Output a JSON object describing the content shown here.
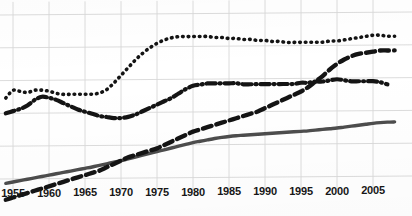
{
  "chart_data": {
    "type": "line",
    "title": "",
    "subtitle": "",
    "xlabel": "",
    "ylabel": "",
    "grid": true,
    "legend_position": "none",
    "xlim": [
      1953.5,
      2008.5
    ],
    "ylim": [
      0,
      100
    ],
    "xticks": [
      1955,
      1960,
      1965,
      1970,
      1975,
      1980,
      1985,
      1990,
      1995,
      2000,
      2005
    ],
    "xtick_labels": [
      "1955",
      "1960",
      "1965",
      "1970",
      "1975",
      "1980",
      "1985",
      "1990",
      "1995",
      "2000",
      "2005"
    ],
    "ytick_labels": [],
    "annotations": [],
    "series": [
      {
        "name": "series-dotted",
        "style": "dotted",
        "color": "#141414",
        "x": [
          1954,
          1955,
          1956,
          1957,
          1958,
          1959,
          1960,
          1961,
          1962,
          1963,
          1964,
          1965,
          1966,
          1967,
          1968,
          1969,
          1970,
          1971,
          1972,
          1973,
          1974,
          1975,
          1976,
          1977,
          1978,
          1979,
          1980,
          1981,
          1982,
          1983,
          1984,
          1985,
          1986,
          1987,
          1988,
          1989,
          1990,
          1991,
          1992,
          1993,
          1994,
          1995,
          1996,
          1997,
          1998,
          1999,
          2000,
          2001,
          2002,
          2003,
          2004,
          2005,
          2006,
          2007,
          2008
        ],
        "values": [
          57.0,
          60.5,
          60.0,
          59.5,
          60.5,
          60.5,
          60.0,
          59.0,
          58.5,
          58.5,
          58.5,
          58.5,
          58.5,
          59.0,
          60.5,
          63.5,
          67.0,
          70.5,
          74.0,
          77.0,
          79.5,
          81.5,
          83.0,
          84.0,
          84.5,
          84.5,
          84.5,
          84.5,
          84.5,
          84.0,
          84.0,
          83.5,
          83.5,
          83.0,
          83.0,
          82.5,
          82.5,
          82.0,
          82.0,
          81.5,
          81.5,
          81.5,
          81.5,
          81.5,
          81.5,
          82.0,
          82.0,
          82.5,
          83.0,
          83.5,
          84.0,
          84.5,
          84.5,
          84.0,
          84.0
        ]
      },
      {
        "name": "series-dashdot",
        "style": "dashdot",
        "color": "#141414",
        "x": [
          1954,
          1955,
          1956,
          1957,
          1958,
          1959,
          1960,
          1961,
          1962,
          1963,
          1964,
          1965,
          1966,
          1967,
          1968,
          1969,
          1970,
          1971,
          1972,
          1973,
          1974,
          1975,
          1976,
          1977,
          1978,
          1979,
          1980,
          1981,
          1982,
          1983,
          1984,
          1985,
          1986,
          1987,
          1988,
          1989,
          1990,
          1991,
          1992,
          1993,
          1994,
          1995,
          1996,
          1997,
          1998,
          1999,
          2000,
          2001,
          2002,
          2003,
          2004,
          2005,
          2006,
          2007
        ],
        "values": [
          50.0,
          51.0,
          52.0,
          53.5,
          56.0,
          57.5,
          57.0,
          56.0,
          54.5,
          53.0,
          51.5,
          50.5,
          49.5,
          48.5,
          48.0,
          47.5,
          47.5,
          48.0,
          49.0,
          50.5,
          52.0,
          53.5,
          55.0,
          56.5,
          58.5,
          60.5,
          62.0,
          62.5,
          63.0,
          63.0,
          63.0,
          63.0,
          63.0,
          62.5,
          62.5,
          62.5,
          62.5,
          62.5,
          62.5,
          62.5,
          62.5,
          63.0,
          63.0,
          63.5,
          63.5,
          64.0,
          64.5,
          64.0,
          63.5,
          63.5,
          63.5,
          63.5,
          63.0,
          62.0
        ]
      },
      {
        "name": "series-dashed",
        "style": "dashed",
        "color": "#141414",
        "x": [
          1954,
          1955,
          1956,
          1957,
          1958,
          1959,
          1960,
          1961,
          1962,
          1963,
          1964,
          1965,
          1966,
          1967,
          1968,
          1969,
          1970,
          1971,
          1972,
          1973,
          1974,
          1975,
          1976,
          1977,
          1978,
          1979,
          1980,
          1981,
          1982,
          1983,
          1984,
          1985,
          1986,
          1987,
          1988,
          1989,
          1990,
          1991,
          1992,
          1993,
          1994,
          1995,
          1996,
          1997,
          1998,
          1999,
          2000,
          2001,
          2002,
          2003,
          2004,
          2005,
          2006,
          2007,
          2008
        ],
        "values": [
          10.5,
          11.5,
          12.5,
          13.5,
          14.5,
          15.5,
          16.5,
          17.5,
          18.5,
          19.5,
          20.5,
          21.5,
          22.5,
          23.5,
          25.0,
          26.5,
          28.0,
          29.5,
          30.5,
          31.5,
          32.5,
          33.5,
          35.0,
          36.5,
          38.0,
          39.5,
          41.0,
          42.0,
          43.0,
          44.0,
          45.0,
          46.0,
          47.0,
          48.0,
          49.0,
          50.0,
          51.5,
          53.0,
          54.5,
          56.0,
          57.5,
          59.0,
          61.0,
          63.5,
          66.0,
          69.0,
          71.5,
          73.5,
          75.0,
          76.0,
          76.5,
          77.0,
          77.5,
          77.5,
          77.5
        ]
      },
      {
        "name": "series-solid",
        "style": "solid",
        "color": "#4d4d4d",
        "x": [
          1954,
          1955,
          1956,
          1957,
          1958,
          1959,
          1960,
          1961,
          1962,
          1963,
          1964,
          1965,
          1966,
          1967,
          1968,
          1969,
          1970,
          1971,
          1972,
          1973,
          1974,
          1975,
          1976,
          1977,
          1978,
          1979,
          1980,
          1981,
          1982,
          1983,
          1984,
          1985,
          1986,
          1987,
          1988,
          1989,
          1990,
          1991,
          1992,
          1993,
          1994,
          1995,
          1996,
          1997,
          1998,
          1999,
          2000,
          2001,
          2002,
          2003,
          2004,
          2005,
          2006,
          2007,
          2008
        ],
        "values": [
          18.0,
          18.6,
          19.2,
          19.8,
          20.4,
          21.0,
          21.6,
          22.2,
          22.8,
          23.4,
          24.0,
          24.6,
          25.2,
          25.9,
          26.6,
          27.3,
          28.0,
          28.8,
          29.6,
          30.4,
          31.2,
          32.0,
          32.8,
          33.6,
          34.4,
          35.2,
          36.0,
          36.6,
          37.2,
          37.8,
          38.3,
          38.7,
          39.0,
          39.2,
          39.4,
          39.6,
          39.8,
          40.0,
          40.2,
          40.4,
          40.6,
          40.8,
          41.0,
          41.3,
          41.6,
          41.9,
          42.2,
          42.6,
          43.0,
          43.4,
          43.8,
          44.2,
          44.5,
          44.7,
          44.8
        ]
      }
    ]
  },
  "grid": {
    "vertical_at_years": [
      1955,
      1960,
      1965,
      1970,
      1975,
      1980,
      1985,
      1990,
      1995,
      2000,
      2005
    ],
    "horizontal_values": [
      95,
      80,
      65,
      50,
      35,
      20
    ],
    "color": "#d8d8d8"
  }
}
